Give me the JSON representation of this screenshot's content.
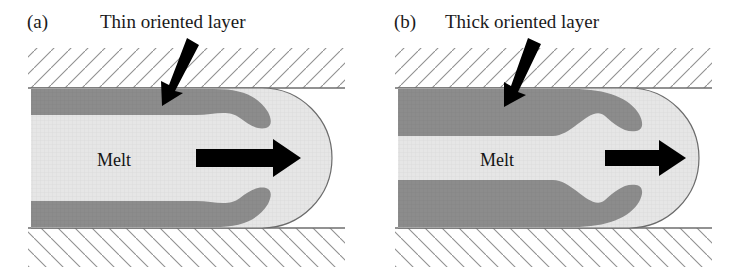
{
  "figure": {
    "background_color": "#ffffff"
  },
  "colors": {
    "melt_fill": "#e4e4e4",
    "oriented_layer_fill": "#8c8c8c",
    "wall_hatch_line": "#8f8f8f",
    "wall_surface_line": "#6e6e6e",
    "outline": "#6b6b6b",
    "arrow_fill": "#000000",
    "text": "#1a1a1a"
  },
  "panels": [
    {
      "id": "a",
      "tag": "(a)",
      "callout_label": "Thin oriented layer",
      "melt_label": "Melt",
      "flow_arrow_name": "flow-direction-arrow",
      "pointer_arrow_name": "callout-pointer-arrow",
      "layer_thickness_px": 26,
      "layer_thickness_relative": "thin",
      "channel": {
        "left_px": 31,
        "right_front_px": 332,
        "top_px": 88,
        "bottom_px": 228,
        "height_px": 140
      }
    },
    {
      "id": "b",
      "tag": "(b)",
      "callout_label": "Thick oriented layer",
      "melt_label": "Melt",
      "flow_arrow_name": "flow-direction-arrow",
      "pointer_arrow_name": "callout-pointer-arrow",
      "layer_thickness_px": 48,
      "layer_thickness_relative": "thick",
      "channel": {
        "left_px": 31,
        "right_front_px": 332,
        "top_px": 88,
        "bottom_px": 228,
        "height_px": 140
      }
    }
  ]
}
